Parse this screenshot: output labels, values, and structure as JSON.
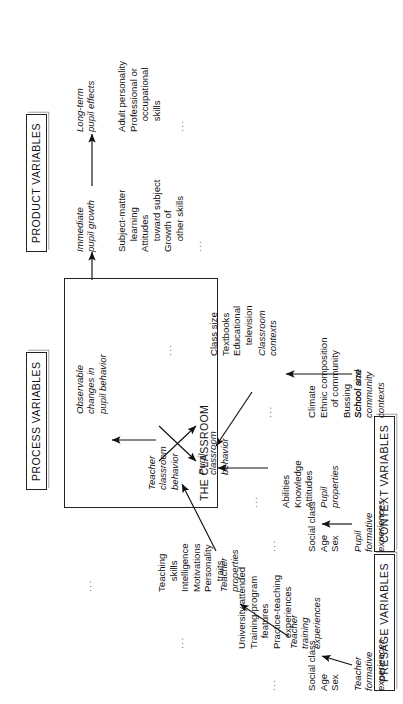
{
  "diagram": {
    "orientation": "rotated-90"
  },
  "boxes": {
    "presage": "PRESAGE VARIABLES",
    "context": "CONTEXT VARIABLES",
    "process": "PROCESS VARIABLES",
    "product": "PRODUCT VARIABLES",
    "classroom": "THE CLASSROOM"
  },
  "presage": {
    "group1": {
      "heading": "Teacher\nformative\nexperiences",
      "items": "Social class\nAge\nSex",
      "ellipsis": "..."
    },
    "group2": {
      "heading": "Teacher\ntraining\nexperiences",
      "items": "University attended\nTraining-program\n    features\nPractice-teaching\n    experiences",
      "ellipsis": "..."
    },
    "group3": {
      "heading": "Teacher\nproperties",
      "items": "Teaching\n    skills\nIntelligence\nMotivations\nPersonality\n    traits",
      "ellipsis": "..."
    }
  },
  "context": {
    "group1": {
      "heading": "Pupil\nformative\nexperiences",
      "items": "Social class\nAge\nSex",
      "ellipsis": "..."
    },
    "group2": {
      "heading": "Pupil\nproperties",
      "items": "Abilities\nKnowledge\nAttitudes",
      "ellipsis": "..."
    },
    "group3": {
      "heading": "School and\ncommunity\ncontexts",
      "items": "Climate\nEthnic composition\n    of community\nBussing\nSchool size",
      "ellipsis": "..."
    },
    "group4": {
      "heading": "Classroom\ncontexts",
      "items": "Class size\nTextbooks\nEducational\n    television",
      "ellipsis": "..."
    }
  },
  "process": {
    "teacher_behavior": "Teacher\nclassroom\nbehavior",
    "pupil_behavior": "Pupil\nclassroom\nbehavior",
    "observable_changes": "Observable\nchanges in\npupil behavior"
  },
  "product": {
    "group1": {
      "heading": "Immediate\npupil growth",
      "items": "Subject-matter\n    learning\nAttitudes\n    toward subject\nGrowth of\n    other skills",
      "ellipsis": "..."
    },
    "group2": {
      "heading": "Long-term\npupil effects",
      "items": "Adult personality\nProfessional or\n    occupational\n    skills",
      "ellipsis": "..."
    }
  },
  "colors": {
    "ink": "#111111",
    "line": "#222222",
    "background": "#ffffff"
  }
}
